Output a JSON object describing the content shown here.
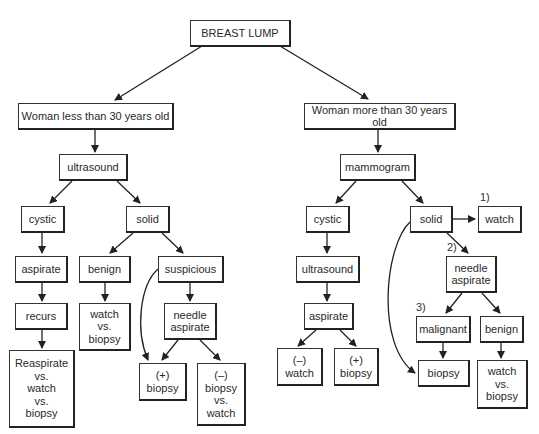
{
  "diagram": {
    "title": "BREAST LUMP",
    "nodes": {
      "root": {
        "lines": [
          "BREAST LUMP"
        ]
      },
      "young": {
        "lines": [
          "Woman less than 30 years old"
        ]
      },
      "young_ultrasound": {
        "lines": [
          "ultrasound"
        ]
      },
      "young_cystic": {
        "lines": [
          "cystic"
        ]
      },
      "young_solid": {
        "lines": [
          "solid"
        ]
      },
      "young_aspirate": {
        "lines": [
          "aspirate"
        ]
      },
      "young_benign": {
        "lines": [
          "benign"
        ]
      },
      "young_suspicious": {
        "lines": [
          "suspicious"
        ]
      },
      "young_recurs": {
        "lines": [
          "recurs"
        ]
      },
      "young_watch_vs_biopsy": {
        "lines": [
          "watch",
          "vs.",
          "biopsy"
        ]
      },
      "young_needle_aspirate": {
        "lines": [
          "needle",
          "aspirate"
        ]
      },
      "young_reaspirate": {
        "lines": [
          "Reaspirate",
          "vs.",
          "watch",
          "vs.",
          "biopsy"
        ]
      },
      "young_pos_biopsy": {
        "lines": [
          "(+)",
          "biopsy"
        ]
      },
      "young_neg_biopsy_vs_watch": {
        "lines": [
          "(–)",
          "biopsy",
          "vs.",
          "watch"
        ]
      },
      "old": {
        "lines": [
          "Woman more than 30 years old"
        ]
      },
      "old_mammogram": {
        "lines": [
          "mammogram"
        ]
      },
      "old_cystic": {
        "lines": [
          "cystic"
        ]
      },
      "old_solid": {
        "lines": [
          "solid"
        ]
      },
      "old_watch": {
        "lines": [
          "watch"
        ]
      },
      "old_ultrasound": {
        "lines": [
          "ultrasound"
        ]
      },
      "old_needle_aspirate": {
        "lines": [
          "needle",
          "aspirate"
        ]
      },
      "old_aspirate": {
        "lines": [
          "aspirate"
        ]
      },
      "old_malignant": {
        "lines": [
          "malignant"
        ]
      },
      "old_benign": {
        "lines": [
          "benign"
        ]
      },
      "old_neg_watch": {
        "lines": [
          "(–)",
          "watch"
        ]
      },
      "old_pos_biopsy": {
        "lines": [
          "(+)",
          "biopsy"
        ]
      },
      "old_biopsy": {
        "lines": [
          "biopsy"
        ]
      },
      "old_watch_vs_biopsy": {
        "lines": [
          "watch",
          "vs.",
          "biopsy"
        ]
      }
    },
    "option_labels": {
      "opt1": "1)",
      "opt2": "2)",
      "opt3": "3)"
    },
    "edges": [
      [
        "root",
        "young"
      ],
      [
        "root",
        "old"
      ],
      [
        "young",
        "young_ultrasound"
      ],
      [
        "young_ultrasound",
        "young_cystic"
      ],
      [
        "young_ultrasound",
        "young_solid"
      ],
      [
        "young_cystic",
        "young_aspirate"
      ],
      [
        "young_aspirate",
        "young_recurs"
      ],
      [
        "young_recurs",
        "young_reaspirate"
      ],
      [
        "young_solid",
        "young_benign"
      ],
      [
        "young_solid",
        "young_suspicious"
      ],
      [
        "young_benign",
        "young_watch_vs_biopsy"
      ],
      [
        "young_suspicious",
        "young_needle_aspirate"
      ],
      [
        "young_suspicious",
        "young_pos_biopsy"
      ],
      [
        "young_needle_aspirate",
        "young_pos_biopsy"
      ],
      [
        "young_needle_aspirate",
        "young_neg_biopsy_vs_watch"
      ],
      [
        "old",
        "old_mammogram"
      ],
      [
        "old_mammogram",
        "old_cystic"
      ],
      [
        "old_mammogram",
        "old_solid"
      ],
      [
        "old_cystic",
        "old_ultrasound"
      ],
      [
        "old_ultrasound",
        "old_aspirate"
      ],
      [
        "old_aspirate",
        "old_neg_watch"
      ],
      [
        "old_aspirate",
        "old_pos_biopsy"
      ],
      [
        "old_solid",
        "old_watch"
      ],
      [
        "old_solid",
        "old_needle_aspirate"
      ],
      [
        "old_solid",
        "old_biopsy"
      ],
      [
        "old_needle_aspirate",
        "old_malignant"
      ],
      [
        "old_needle_aspirate",
        "old_benign"
      ],
      [
        "old_malignant",
        "old_biopsy"
      ],
      [
        "old_benign",
        "old_watch_vs_biopsy"
      ]
    ],
    "colors": {
      "line": "#222222",
      "box_fill": "#ffffff",
      "text": "#2a2a2a"
    }
  }
}
